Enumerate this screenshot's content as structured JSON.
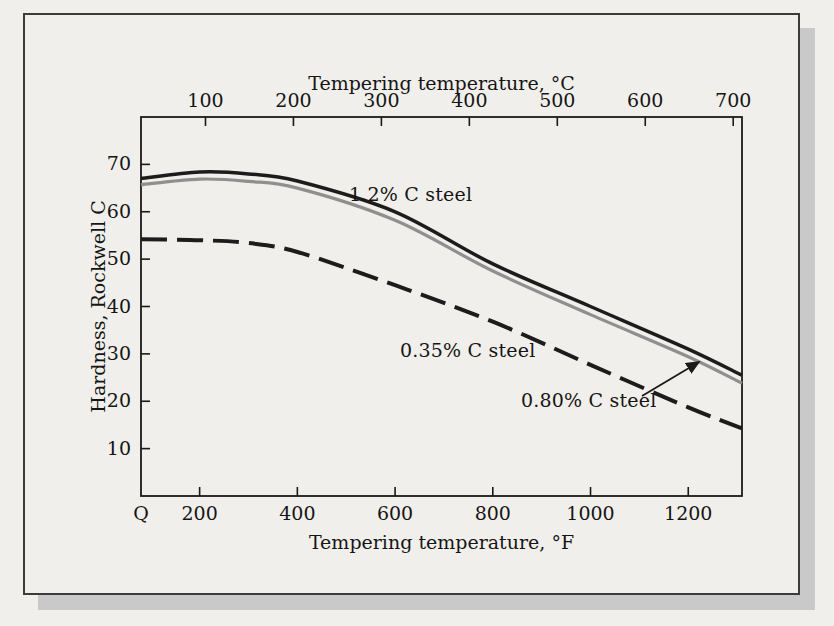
{
  "figure": {
    "background_color": "#f1efeb",
    "frame_border_color": "#3c3c3c",
    "shadow_color": "#c9c9c9",
    "axis_color": "#1a1a1a",
    "text_color": "#151515"
  },
  "chart_data": {
    "type": "line",
    "title": "",
    "x_axis_top": {
      "label": "Tempering temperature, °C",
      "ticks": [
        100,
        200,
        300,
        400,
        500,
        600,
        700
      ],
      "unit": "C"
    },
    "x_axis_bottom": {
      "label": "Tempering temperature, °F",
      "origin_label": "Q",
      "ticks": [
        200,
        400,
        600,
        800,
        1000,
        1200
      ],
      "range": [
        80,
        1310
      ],
      "unit": "F"
    },
    "y_axis": {
      "label": "Hardness, Rockwell C",
      "ticks": [
        10,
        20,
        30,
        40,
        50,
        60,
        70
      ],
      "range": [
        0,
        80
      ]
    },
    "grid": false,
    "legend": "inline-annotations",
    "series": [
      {
        "name": "1.2% C steel",
        "color": "#1c1c1c",
        "style": "solid",
        "stroke_width": 3.5,
        "x_f": [
          80,
          200,
          300,
          400,
          600,
          800,
          1000,
          1200,
          1310
        ],
        "values": [
          67,
          68.4,
          68,
          66.5,
          60,
          49,
          40,
          31,
          25.5
        ]
      },
      {
        "name": "0.80% C steel",
        "color": "#8f8f8f",
        "style": "solid",
        "stroke_width": 3.2,
        "x_f": [
          80,
          200,
          300,
          400,
          600,
          800,
          1000,
          1200,
          1310
        ],
        "values": [
          65.7,
          66.9,
          66.4,
          65,
          58.2,
          47.5,
          38.3,
          29.4,
          23.8
        ]
      },
      {
        "name": "0.35% C steel",
        "color": "#1c1c1c",
        "style": "dashed",
        "stroke_width": 4,
        "dash_pattern": "26 10",
        "x_f": [
          80,
          200,
          300,
          400,
          600,
          800,
          1000,
          1200,
          1310
        ],
        "values": [
          54.2,
          54,
          53.4,
          51.5,
          44.5,
          36.8,
          27.7,
          18.7,
          14.3
        ]
      }
    ],
    "annotations": [
      {
        "text": "1.2% C steel",
        "target_series": "1.2% C steel",
        "arrow": false
      },
      {
        "text": "0.35% C steel",
        "target_series": "0.35% C steel",
        "arrow": false
      },
      {
        "text": "0.80% C steel",
        "target_series": "0.80% C steel",
        "arrow": true
      }
    ]
  }
}
